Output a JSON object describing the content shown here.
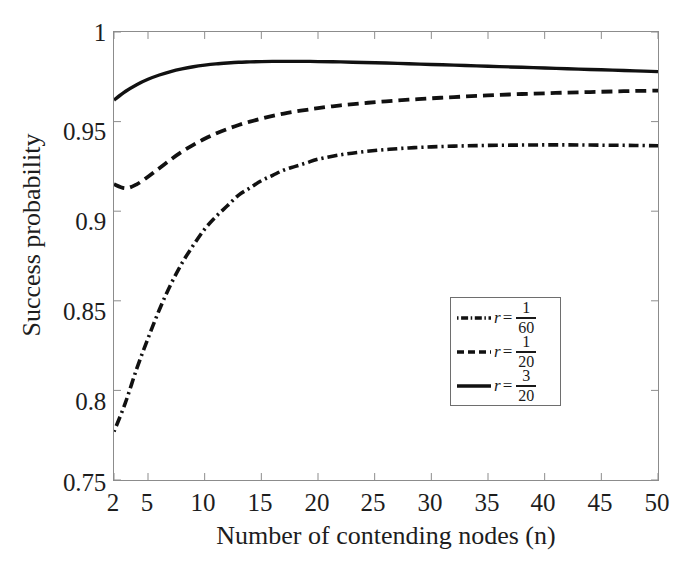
{
  "chart_data": {
    "type": "line",
    "title": "",
    "xlabel": "Number of contending nodes (n)",
    "ylabel": "Success probability",
    "xlim": [
      2,
      50
    ],
    "ylim": [
      0.75,
      1
    ],
    "grid": false,
    "legend_position": "center-right",
    "xticks": [
      2,
      5,
      10,
      15,
      20,
      25,
      30,
      35,
      40,
      45,
      50
    ],
    "xtick_labels": [
      "2",
      "5",
      "10",
      "15",
      "20",
      "25",
      "30",
      "35",
      "40",
      "45",
      "50"
    ],
    "yticks": [
      0.75,
      0.8,
      0.85,
      0.9,
      0.95,
      1
    ],
    "ytick_labels": [
      "0.75",
      "0.8",
      "0.85",
      "0.9",
      "0.95",
      "1"
    ],
    "x": [
      2,
      3,
      4,
      5,
      6,
      7,
      8,
      9,
      10,
      11,
      12,
      13,
      14,
      15,
      16,
      17,
      18,
      19,
      20,
      22,
      24,
      26,
      28,
      30,
      32,
      34,
      36,
      38,
      40,
      42,
      44,
      46,
      48,
      50
    ],
    "series": [
      {
        "name": "r = 1/60",
        "style": "dash-dot",
        "color": "#111111",
        "values": [
          0.777,
          0.793,
          0.812,
          0.829,
          0.845,
          0.859,
          0.871,
          0.881,
          0.89,
          0.897,
          0.903,
          0.909,
          0.913,
          0.917,
          0.92,
          0.923,
          0.925,
          0.927,
          0.929,
          0.9315,
          0.9332,
          0.9344,
          0.9353,
          0.9359,
          0.9363,
          0.9366,
          0.9368,
          0.9369,
          0.937,
          0.937,
          0.9369,
          0.9368,
          0.9367,
          0.9365
        ]
      },
      {
        "name": "r = 1/20",
        "style": "dashed",
        "color": "#111111",
        "values": [
          0.915,
          0.9128,
          0.915,
          0.9192,
          0.924,
          0.9288,
          0.9332,
          0.937,
          0.9404,
          0.9434,
          0.9459,
          0.9481,
          0.95,
          0.9517,
          0.9532,
          0.9545,
          0.9556,
          0.9566,
          0.9575,
          0.9591,
          0.9603,
          0.9613,
          0.9622,
          0.963,
          0.9637,
          0.9643,
          0.9649,
          0.9654,
          0.9658,
          0.9662,
          0.9665,
          0.9668,
          0.9671,
          0.9673
        ]
      },
      {
        "name": "r = 3/20",
        "style": "solid",
        "color": "#111111",
        "values": [
          0.962,
          0.9668,
          0.9706,
          0.9736,
          0.976,
          0.9779,
          0.9794,
          0.9806,
          0.9815,
          0.9822,
          0.9827,
          0.9831,
          0.9833,
          0.9835,
          0.9836,
          0.9836,
          0.9836,
          0.9836,
          0.9835,
          0.9833,
          0.983,
          0.9827,
          0.9823,
          0.9819,
          0.9815,
          0.9811,
          0.9807,
          0.9803,
          0.9799,
          0.9795,
          0.9791,
          0.9787,
          0.9783,
          0.9779
        ]
      }
    ],
    "legend": [
      {
        "label": "r = 1/60",
        "variable": "r",
        "equals": "=",
        "numerator": "1",
        "denominator": "60",
        "style": "dash-dot"
      },
      {
        "label": "r = 1/20",
        "variable": "r",
        "equals": "=",
        "numerator": "1",
        "denominator": "20",
        "style": "dashed"
      },
      {
        "label": "r = 3/20",
        "variable": "r",
        "equals": "=",
        "numerator": "3",
        "denominator": "20",
        "style": "solid"
      }
    ]
  },
  "axes": {
    "ylabel": "Success probability",
    "xlabel": "Number of contending nodes (n)",
    "ytick_labels": [
      "1",
      "0.95",
      "0.9",
      "0.85",
      "0.8",
      "0.75"
    ],
    "xtick_labels": [
      "2",
      "5",
      "10",
      "15",
      "20",
      "25",
      "30",
      "35",
      "40",
      "45",
      "50"
    ]
  }
}
